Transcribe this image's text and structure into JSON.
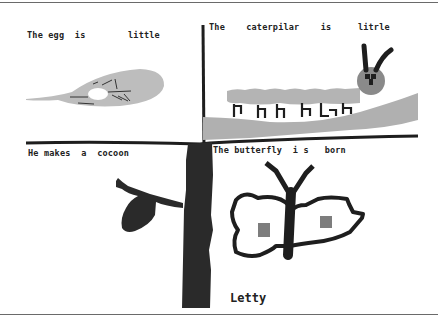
{
  "artwork": {
    "title": "Butterfly life cycle drawing",
    "panels": [
      {
        "id": "egg",
        "caption": "The egg  is        little"
      },
      {
        "id": "caterpillar",
        "caption": "The    caterpilar    is     litrle"
      },
      {
        "id": "cocoon",
        "caption": "He makes  a  cocoon"
      },
      {
        "id": "butterfly",
        "caption": "The butterfly  i s   born"
      }
    ],
    "signature": "Letty",
    "colors": {
      "ink": "#1e1e1e",
      "leaf_gray": "#bdbdbd",
      "stem_gray": "#a8a8a8",
      "caterpillar_body": "#b4b4b4",
      "caterpillar_head": "#8a8a8a",
      "wing_spot": "#7d7d7d",
      "frame": "#6a6a6a",
      "background": "#ffffff"
    }
  }
}
